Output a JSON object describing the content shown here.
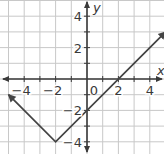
{
  "chart_data": {
    "type": "line",
    "title": "",
    "xlabel": "x",
    "ylabel": "y",
    "xlim": [
      -5,
      5
    ],
    "ylim": [
      -5,
      5
    ],
    "grid": true,
    "x_ticks": [
      -4,
      -2,
      0,
      2,
      4
    ],
    "y_ticks": [
      -4,
      -2,
      2,
      4
    ],
    "x_tick_labels": [
      "−4",
      "−2",
      "0",
      "2",
      "4"
    ],
    "y_tick_labels": [
      "−4",
      "−2",
      "2",
      "4"
    ],
    "origin_label": "0",
    "series": [
      {
        "name": "y = |x + 2| − 4",
        "points": [
          [
            -5,
            -1
          ],
          [
            -2,
            -4
          ],
          [
            5,
            3
          ]
        ],
        "arrows_both_ends": true,
        "color": "#444444"
      }
    ],
    "key_points": {
      "vertex": [
        -2,
        -4
      ],
      "x_intercept": [
        2,
        0
      ],
      "y_intercept": [
        0,
        -2
      ]
    },
    "colors": {
      "grid": "#c8c8c8",
      "axis": "#3a3a3a",
      "line": "#444444"
    }
  }
}
